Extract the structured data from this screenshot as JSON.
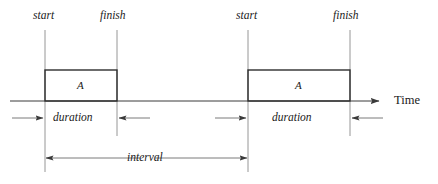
{
  "diagram": {
    "axis": {
      "label": "Time",
      "name": "time-axis",
      "y": 101,
      "x_start": 10,
      "x_end": 385,
      "arrow": "right"
    },
    "colors": {
      "stroke": "#3a3a3a",
      "thin_stroke": "#6b6b6b",
      "text": "#1a1a1a",
      "background": "#ffffff"
    },
    "events": [
      {
        "id": "event-1",
        "box_label": "A",
        "start_label": "start",
        "finish_label": "finish",
        "duration_label": "duration",
        "start_x": 45,
        "finish_x": 117,
        "box_top": 70,
        "box_bottom": 101
      },
      {
        "id": "event-2",
        "box_label": "A",
        "start_label": "start",
        "finish_label": "finish",
        "duration_label": "duration",
        "start_x": 248,
        "finish_x": 350,
        "box_top": 70,
        "box_bottom": 101
      }
    ],
    "interval": {
      "label": "interval",
      "from_x": 45,
      "to_x": 248,
      "y": 158
    },
    "duration_row_y": 118
  }
}
